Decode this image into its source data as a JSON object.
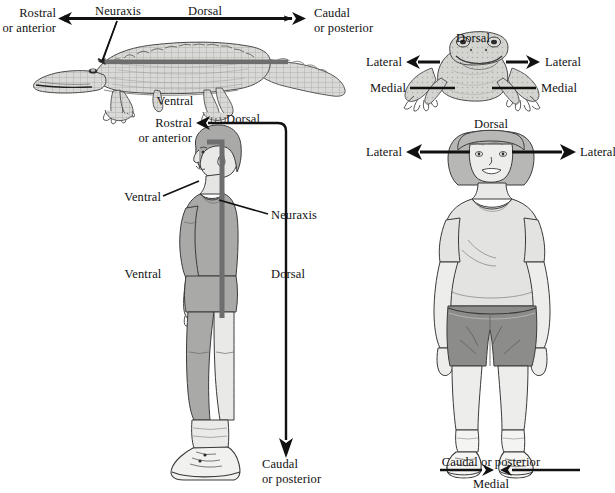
{
  "figure": {
    "title_implied": "Anatomical directions in four animal/human views",
    "panels": [
      {
        "id": "crocodile",
        "name": "crocodile-lateral-view",
        "labels": [
          {
            "key": "rostral",
            "text": "Rostral\nor anterior"
          },
          {
            "key": "neuraxis",
            "text": "Neuraxis"
          },
          {
            "key": "dorsal",
            "text": "Dorsal"
          },
          {
            "key": "caudal",
            "text": "Caudal\nor posterior"
          },
          {
            "key": "ventral",
            "text": "Ventral"
          }
        ]
      },
      {
        "id": "frog",
        "name": "frog-dorsal-view",
        "labels": [
          {
            "key": "dorsal",
            "text": "Dorsal"
          },
          {
            "key": "lateral_left",
            "text": "Lateral"
          },
          {
            "key": "lateral_right",
            "text": "Lateral"
          },
          {
            "key": "medial_left",
            "text": "Medial"
          },
          {
            "key": "medial_right",
            "text": "Medial"
          }
        ]
      },
      {
        "id": "man",
        "name": "human-lateral-view",
        "labels": [
          {
            "key": "rostral",
            "text": "Rostral\nor anterior"
          },
          {
            "key": "dorsal_top",
            "text": "Dorsal"
          },
          {
            "key": "ventral_upper",
            "text": "Ventral"
          },
          {
            "key": "neuraxis",
            "text": "Neuraxis"
          },
          {
            "key": "ventral_lower",
            "text": "Ventral"
          },
          {
            "key": "dorsal_lower",
            "text": "Dorsal"
          },
          {
            "key": "caudal",
            "text": "Caudal\nor posterior"
          }
        ]
      },
      {
        "id": "woman",
        "name": "human-anterior-view",
        "labels": [
          {
            "key": "dorsal",
            "text": "Dorsal"
          },
          {
            "key": "lateral_left",
            "text": "Lateral"
          },
          {
            "key": "lateral_right",
            "text": "Lateral"
          },
          {
            "key": "caudal",
            "text": "Caudal or posterior"
          },
          {
            "key": "medial",
            "text": "Medial"
          }
        ]
      }
    ],
    "colors": {
      "ink": "#111111",
      "outline": "#3a3a3a",
      "neuraxis_bar": "#6e6e6e",
      "croc_body": "#d8d8d6",
      "croc_body_dark": "#bdbdba",
      "man_clothing": "#a9a9a9",
      "man_skin": "#e7e7e5",
      "woman_shirt": "#e2e2e0",
      "woman_shorts": "#8c8c8c",
      "woman_hair": "#b5b5b3",
      "frog_body": "#d2d2cf",
      "paper": "#ffffff"
    }
  }
}
